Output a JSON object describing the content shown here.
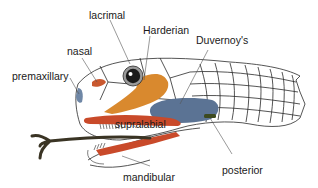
{
  "diagram": {
    "labels": {
      "lacrimal": "lacrimal",
      "harderian": "Harderian",
      "duvernoys": "Duvernoy's",
      "nasal": "nasal",
      "premaxillary": "premaxillary",
      "supralabial": "supralabial",
      "posterior": "posterior",
      "mandibular": "mandibular"
    },
    "colors": {
      "harderian_gland": "#d9892e",
      "duvernoys_gland": "#5b7394",
      "labial_gland": "#c94a2a",
      "nasal_gland": "#c9582f",
      "premaxillary_gland": "#6f87a6",
      "posterior_gland": "#3d4a1f",
      "tongue": "#3a3424",
      "outline": "#2a2a2a",
      "eye_ring": "#9a9a9a"
    }
  }
}
